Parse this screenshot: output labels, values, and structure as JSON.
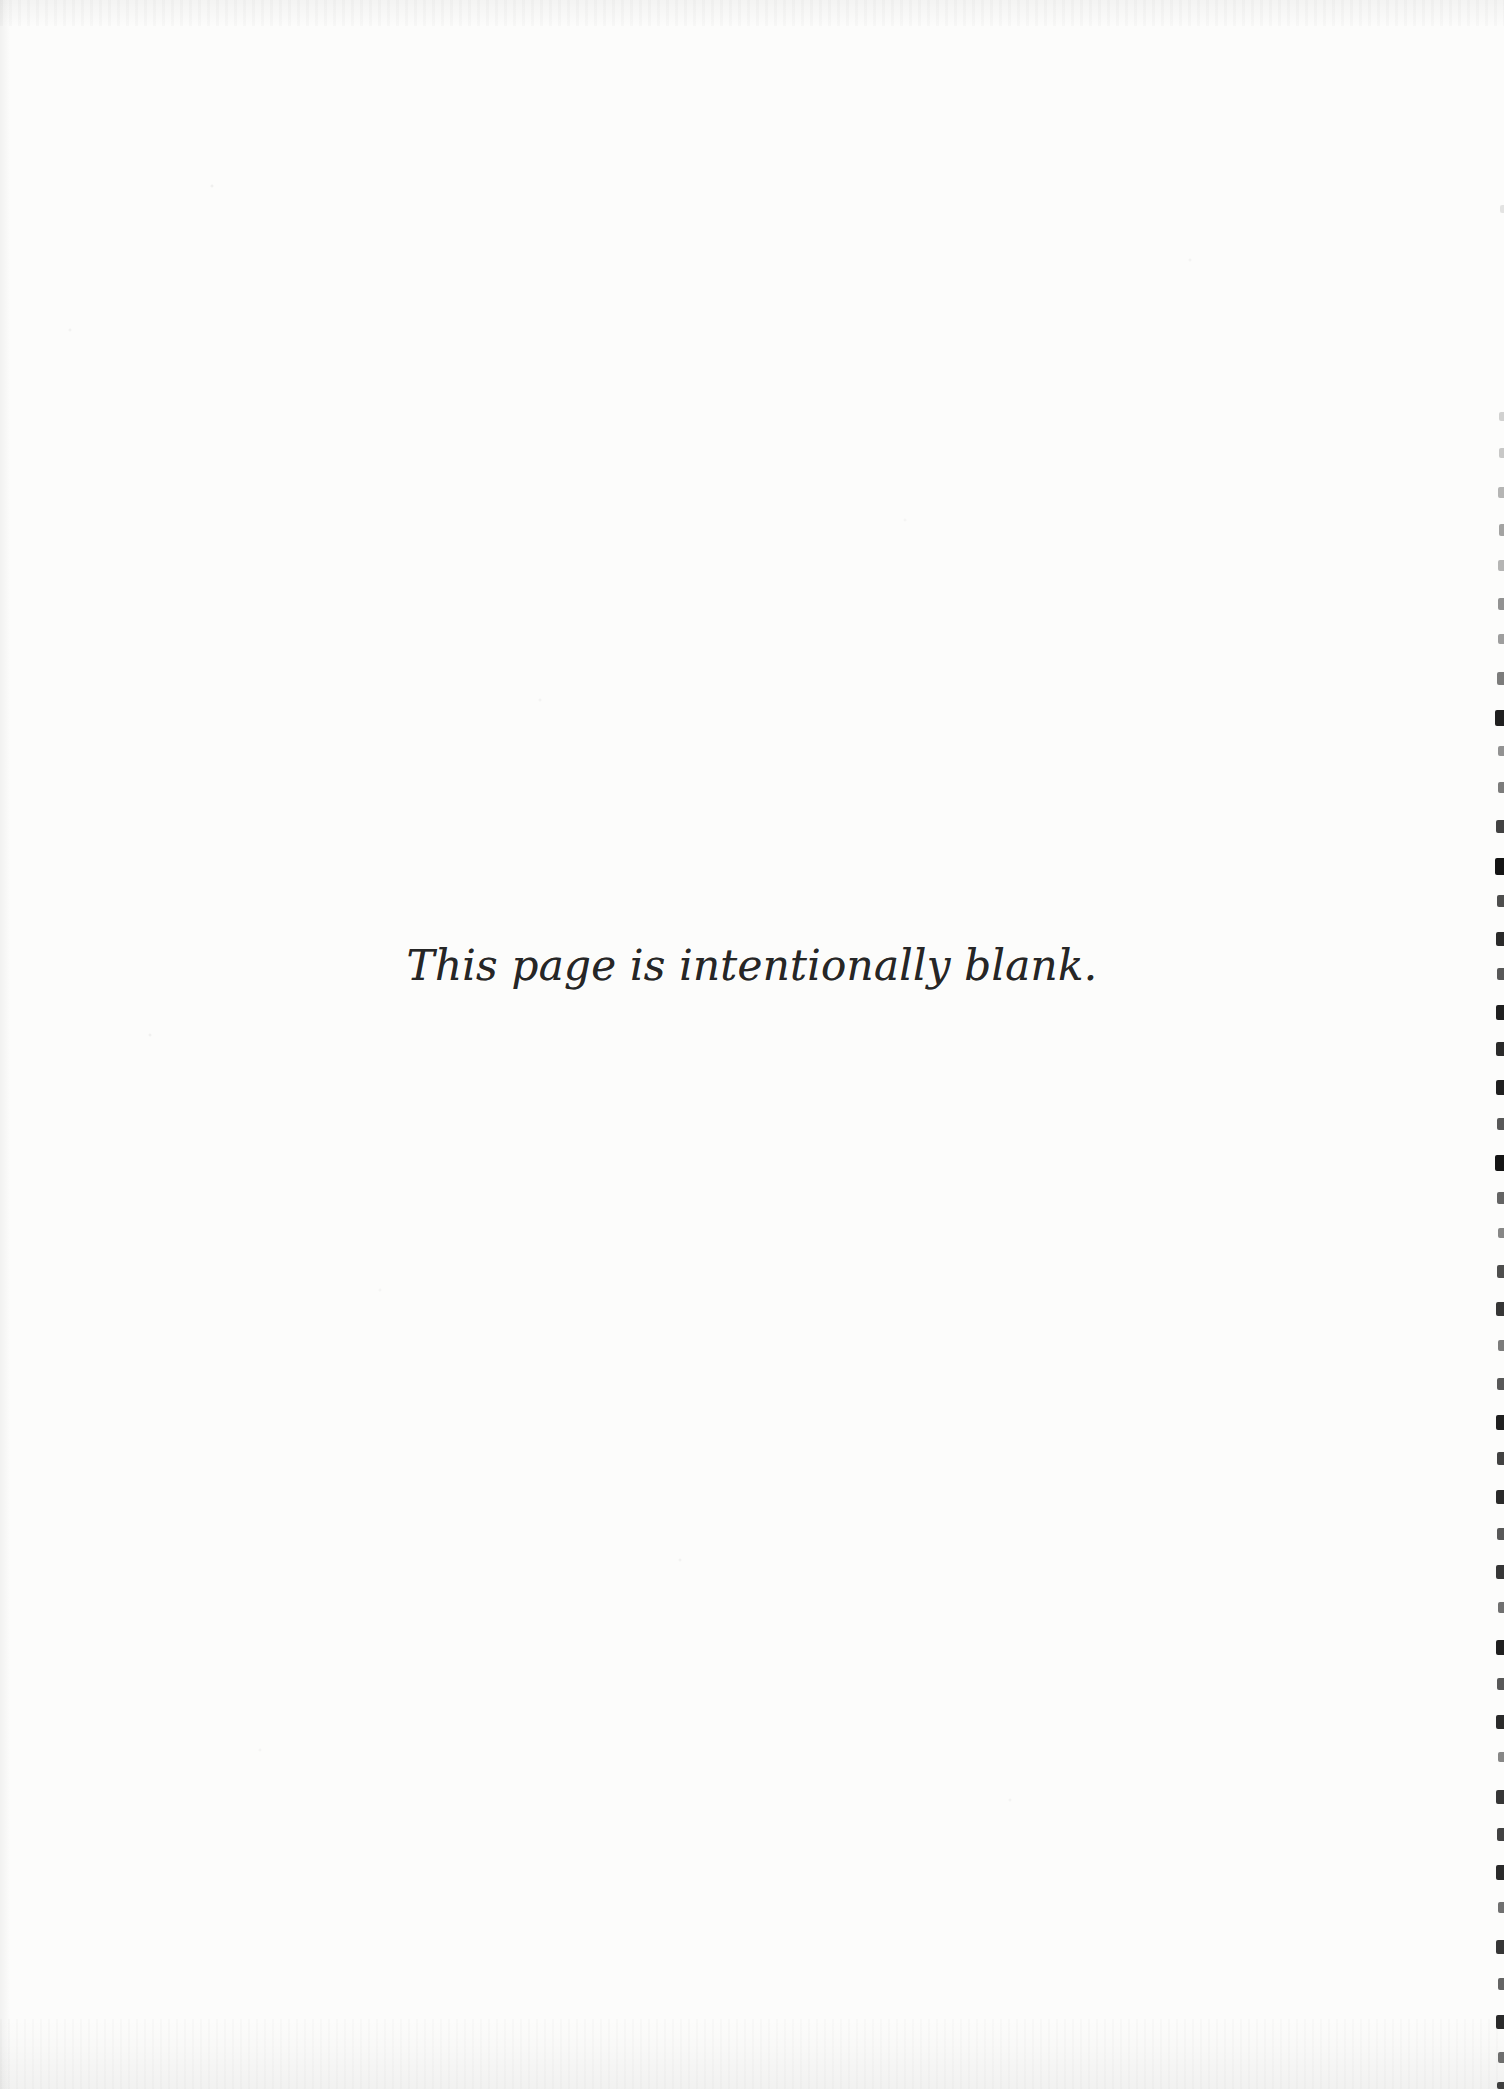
{
  "page": {
    "notice_text": "This page is intentionally blank.",
    "paper_color": "#fcfcfb",
    "ink_color": "#262626"
  },
  "scan_artifacts": {
    "binding_mark_color": "#141414",
    "binding_marks": [
      {
        "y": 205,
        "w": 4,
        "h": 8,
        "o": 0.1
      },
      {
        "y": 412,
        "w": 5,
        "h": 9,
        "o": 0.18
      },
      {
        "y": 448,
        "w": 5,
        "h": 10,
        "o": 0.22
      },
      {
        "y": 487,
        "w": 6,
        "h": 11,
        "o": 0.3
      },
      {
        "y": 524,
        "w": 5,
        "h": 12,
        "o": 0.38
      },
      {
        "y": 560,
        "w": 6,
        "h": 11,
        "o": 0.3
      },
      {
        "y": 598,
        "w": 6,
        "h": 12,
        "o": 0.45
      },
      {
        "y": 634,
        "w": 6,
        "h": 10,
        "o": 0.4
      },
      {
        "y": 672,
        "w": 7,
        "h": 13,
        "o": 0.55
      },
      {
        "y": 710,
        "w": 9,
        "h": 16,
        "o": 0.95
      },
      {
        "y": 746,
        "w": 6,
        "h": 10,
        "o": 0.45
      },
      {
        "y": 782,
        "w": 6,
        "h": 11,
        "o": 0.55
      },
      {
        "y": 820,
        "w": 8,
        "h": 13,
        "o": 0.8
      },
      {
        "y": 858,
        "w": 9,
        "h": 17,
        "o": 1.0
      },
      {
        "y": 895,
        "w": 7,
        "h": 12,
        "o": 0.75
      },
      {
        "y": 932,
        "w": 8,
        "h": 14,
        "o": 0.9
      },
      {
        "y": 968,
        "w": 7,
        "h": 12,
        "o": 0.7
      },
      {
        "y": 1005,
        "w": 8,
        "h": 15,
        "o": 0.95
      },
      {
        "y": 1042,
        "w": 8,
        "h": 14,
        "o": 0.9
      },
      {
        "y": 1080,
        "w": 8,
        "h": 15,
        "o": 0.95
      },
      {
        "y": 1118,
        "w": 7,
        "h": 12,
        "o": 0.7
      },
      {
        "y": 1155,
        "w": 9,
        "h": 16,
        "o": 1.0
      },
      {
        "y": 1192,
        "w": 7,
        "h": 12,
        "o": 0.65
      },
      {
        "y": 1228,
        "w": 6,
        "h": 10,
        "o": 0.5
      },
      {
        "y": 1265,
        "w": 7,
        "h": 13,
        "o": 0.75
      },
      {
        "y": 1302,
        "w": 8,
        "h": 14,
        "o": 0.85
      },
      {
        "y": 1340,
        "w": 6,
        "h": 11,
        "o": 0.55
      },
      {
        "y": 1378,
        "w": 7,
        "h": 12,
        "o": 0.7
      },
      {
        "y": 1415,
        "w": 8,
        "h": 15,
        "o": 0.95
      },
      {
        "y": 1452,
        "w": 7,
        "h": 13,
        "o": 0.8
      },
      {
        "y": 1490,
        "w": 8,
        "h": 14,
        "o": 0.9
      },
      {
        "y": 1528,
        "w": 7,
        "h": 12,
        "o": 0.7
      },
      {
        "y": 1565,
        "w": 8,
        "h": 14,
        "o": 0.85
      },
      {
        "y": 1602,
        "w": 6,
        "h": 11,
        "o": 0.6
      },
      {
        "y": 1640,
        "w": 8,
        "h": 15,
        "o": 0.95
      },
      {
        "y": 1678,
        "w": 7,
        "h": 12,
        "o": 0.7
      },
      {
        "y": 1715,
        "w": 8,
        "h": 14,
        "o": 0.9
      },
      {
        "y": 1752,
        "w": 6,
        "h": 10,
        "o": 0.5
      },
      {
        "y": 1790,
        "w": 8,
        "h": 14,
        "o": 0.85
      },
      {
        "y": 1828,
        "w": 7,
        "h": 13,
        "o": 0.8
      },
      {
        "y": 1865,
        "w": 8,
        "h": 15,
        "o": 0.9
      },
      {
        "y": 1902,
        "w": 6,
        "h": 11,
        "o": 0.6
      },
      {
        "y": 1940,
        "w": 8,
        "h": 14,
        "o": 0.85
      },
      {
        "y": 1978,
        "w": 6,
        "h": 12,
        "o": 0.65
      },
      {
        "y": 2015,
        "w": 8,
        "h": 14,
        "o": 0.9
      },
      {
        "y": 2052,
        "w": 6,
        "h": 11,
        "o": 0.6
      },
      {
        "y": 2082,
        "w": 7,
        "h": 7,
        "o": 0.8
      }
    ]
  }
}
